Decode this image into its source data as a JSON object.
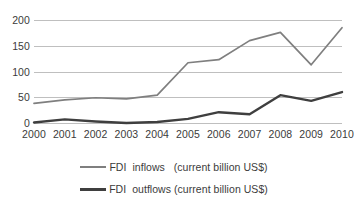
{
  "chart_data": {
    "type": "line",
    "title": "",
    "subtitle": "",
    "xlabel": "",
    "ylabel": "",
    "categories": [
      "2000",
      "2001",
      "2002",
      "2003",
      "2004",
      "2005",
      "2006",
      "2007",
      "2008",
      "2009",
      "2010"
    ],
    "x": [
      2000,
      2001,
      2002,
      2003,
      2004,
      2005,
      2006,
      2007,
      2008,
      2009,
      2010
    ],
    "series": [
      {
        "name": "FDI  inflows   (current billion US$)",
        "color": "#7f7f7f",
        "values": [
          38,
          45,
          49,
          47,
          54,
          117,
          123,
          160,
          176,
          113,
          185
        ]
      },
      {
        "name": "FDI  outflows (current billion US$)",
        "color": "#3f3f3f",
        "values": [
          1,
          7,
          3,
          0,
          2,
          8,
          21,
          17,
          54,
          43,
          60
        ]
      }
    ],
    "ylim": [
      0,
      200
    ],
    "yticks": [
      0,
      50,
      100,
      150,
      200
    ],
    "ytick_labels": [
      "0",
      "50",
      "100",
      "150",
      "200"
    ],
    "grid": true,
    "grid_axis": "y",
    "legend_position": "bottom"
  },
  "legend": {
    "entries": [
      {
        "label": "FDI  inflows   (current billion US$)",
        "swatch": "inflow"
      },
      {
        "label": "FDI  outflows (current billion US$)",
        "swatch": "outflow"
      }
    ]
  },
  "colors": {
    "inflows_line": "#7f7f7f",
    "outflows_line": "#3f3f3f",
    "gridline": "#bfbfbf",
    "text": "#3b3b3b",
    "background": "#ffffff"
  }
}
